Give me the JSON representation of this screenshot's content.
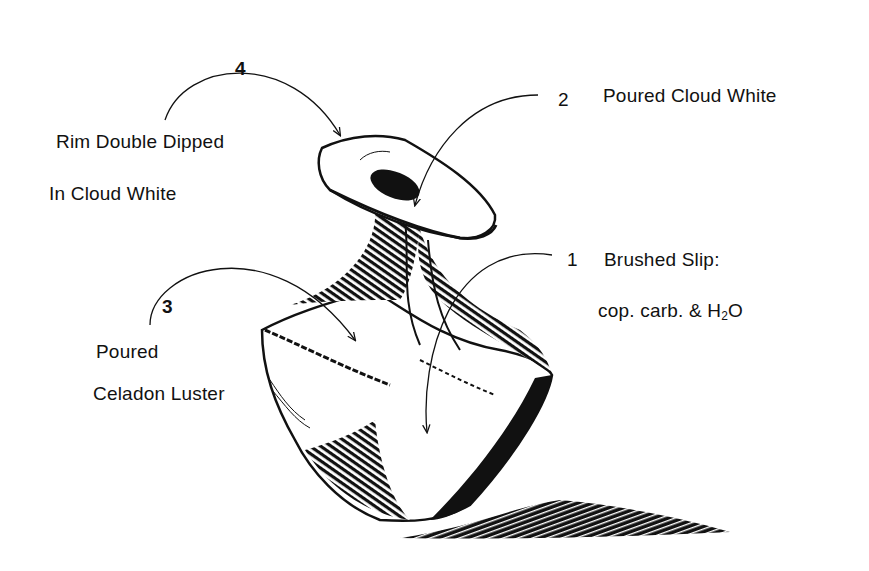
{
  "diagram": {
    "colors": {
      "ink": "#111111",
      "background": "#ffffff"
    },
    "callouts": [
      {
        "number": "4",
        "lines": [
          "Rim Double Dipped",
          "In Cloud White"
        ],
        "target": "rim"
      },
      {
        "number": "2",
        "lines": [
          "Poured Cloud White"
        ],
        "target": "mouth interior"
      },
      {
        "number": "1",
        "lines": [
          "Brushed Slip:",
          "cop. carb. & H2O"
        ],
        "formula": {
          "prefix": "cop. carb. & H",
          "subscript": "2",
          "suffix": "O"
        },
        "target": "body front"
      },
      {
        "number": "3",
        "lines": [
          "Poured",
          "Celadon Luster"
        ],
        "target": "shoulder"
      }
    ]
  }
}
